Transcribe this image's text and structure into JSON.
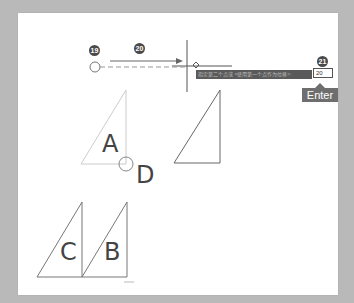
{
  "steps": {
    "step19": "19",
    "step20": "20",
    "step21": "21"
  },
  "command_bar": {
    "prompt_text": "指定第二个点或 <使用第一个点作为位移>:",
    "input_value": "20"
  },
  "enter_key": {
    "label": "Enter"
  },
  "shapes": {
    "a_label": "A",
    "b_label": "B",
    "c_label": "C",
    "d_label": "D"
  },
  "colors": {
    "background": "#b9b9b9",
    "panel": "#ffffff",
    "command_bar": "#5a5a5a",
    "enter_key": "#6e6e6e"
  }
}
